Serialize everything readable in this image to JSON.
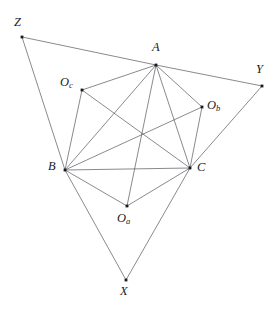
{
  "figure": {
    "width": 278,
    "height": 312,
    "background_color": "#ffffff",
    "edge_color": "#4a4a52",
    "highlight_edge_color": "#8a8a90",
    "vertex_color": "#1a1a1a"
  },
  "points": {
    "Z": {
      "label": "Z",
      "sub": "",
      "x": 22,
      "y": 37,
      "label_x": 14,
      "label_y": 16
    },
    "A": {
      "label": "A",
      "sub": "",
      "x": 156,
      "y": 65,
      "label_x": 152,
      "label_y": 41
    },
    "Y": {
      "label": "Y",
      "sub": "",
      "x": 262,
      "y": 86,
      "label_x": 256,
      "label_y": 63
    },
    "Oc": {
      "label": "O",
      "sub": "c",
      "x": 82,
      "y": 90,
      "label_x": 60,
      "label_y": 76
    },
    "Ob": {
      "label": "O",
      "sub": "b",
      "x": 202,
      "y": 107,
      "label_x": 207,
      "label_y": 99
    },
    "B": {
      "label": "B",
      "sub": "",
      "x": 65,
      "y": 170,
      "label_x": 48,
      "label_y": 160
    },
    "C": {
      "label": "C",
      "sub": "",
      "x": 190,
      "y": 168,
      "label_x": 197,
      "label_y": 161
    },
    "Oa": {
      "label": "O",
      "sub": "a",
      "x": 127,
      "y": 206,
      "label_x": 117,
      "label_y": 212
    },
    "X": {
      "label": "X",
      "sub": "",
      "x": 126,
      "y": 280,
      "label_x": 120,
      "label_y": 285
    }
  },
  "edges": [
    {
      "name": "edge-Z-A",
      "from": "Z",
      "to": "A",
      "style": "normal"
    },
    {
      "name": "edge-A-Y",
      "from": "A",
      "to": "Y",
      "style": "normal"
    },
    {
      "name": "edge-Z-B",
      "from": "Z",
      "to": "B",
      "style": "normal"
    },
    {
      "name": "edge-B-X",
      "from": "B",
      "to": "X",
      "style": "normal"
    },
    {
      "name": "edge-X-C",
      "from": "X",
      "to": "C",
      "style": "normal"
    },
    {
      "name": "edge-C-Y",
      "from": "C",
      "to": "Y",
      "style": "normal"
    },
    {
      "name": "edge-A-B",
      "from": "A",
      "to": "B",
      "style": "normal"
    },
    {
      "name": "edge-A-C",
      "from": "A",
      "to": "C",
      "style": "normal"
    },
    {
      "name": "edge-B-C",
      "from": "B",
      "to": "C",
      "style": "highlight"
    },
    {
      "name": "edge-A-Oc",
      "from": "A",
      "to": "Oc",
      "style": "normal"
    },
    {
      "name": "edge-A-Ob",
      "from": "A",
      "to": "Ob",
      "style": "normal"
    },
    {
      "name": "edge-A-Oa",
      "from": "A",
      "to": "Oa",
      "style": "normal"
    },
    {
      "name": "edge-B-Oc",
      "from": "B",
      "to": "Oc",
      "style": "normal"
    },
    {
      "name": "edge-B-Ob",
      "from": "B",
      "to": "Ob",
      "style": "normal"
    },
    {
      "name": "edge-B-Oa",
      "from": "B",
      "to": "Oa",
      "style": "normal"
    },
    {
      "name": "edge-C-Oc",
      "from": "C",
      "to": "Oc",
      "style": "normal"
    },
    {
      "name": "edge-C-Ob",
      "from": "C",
      "to": "Ob",
      "style": "normal"
    },
    {
      "name": "edge-C-Oa",
      "from": "C",
      "to": "Oa",
      "style": "normal"
    }
  ]
}
